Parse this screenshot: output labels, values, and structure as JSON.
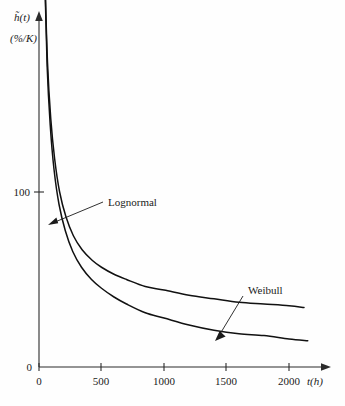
{
  "figure": {
    "background_color": "#fefefe",
    "ink_color": "#111111"
  },
  "labels": {
    "y_axis_symbol": "h̃(t)",
    "y_axis_unit": "(%/K)",
    "x_axis_title": "t(h)",
    "y_origin_label": "0"
  },
  "chart_data": {
    "type": "line",
    "title": "",
    "subtitle": "",
    "xlabel": "t(h)",
    "ylabel": "h̃(t) (%/K)",
    "xlim": [
      0,
      2250
    ],
    "ylim": [
      0,
      560
    ],
    "grid": false,
    "legend_position": "inline-annotations",
    "x_ticks": [
      0,
      500,
      1000,
      1500,
      2000
    ],
    "x_tick_labels": [
      "0",
      "500",
      "1000",
      "1500",
      "2000"
    ],
    "y_ticks": [
      0,
      100
    ],
    "y_tick_labels": [
      "0",
      "100"
    ],
    "annotations": [
      {
        "text": "Lognormal",
        "target_x": 40,
        "target_y": 150,
        "note": "leader arrow points down-left to lower-left steep curve"
      },
      {
        "text": "Weibull",
        "target_x": 1390,
        "target_y": 36,
        "note": "leader arrow points down-left to the upper right-hand curve"
      }
    ],
    "series": [
      {
        "name": "Lognormal",
        "x": [
          12,
          20,
          30,
          45,
          65,
          90,
          120,
          160,
          210,
          270,
          340,
          420,
          500,
          600,
          700,
          850,
          1000,
          1200,
          1400,
          1600,
          1800,
          2000,
          2150
        ],
        "values": [
          545,
          400,
          300,
          225,
          172,
          138,
          113,
          93,
          78,
          66,
          57,
          50,
          45,
          40,
          36,
          31,
          28,
          24,
          21,
          19,
          18,
          16,
          15
        ]
      },
      {
        "name": "Weibull",
        "x": [
          14,
          22,
          33,
          48,
          68,
          94,
          125,
          165,
          215,
          275,
          345,
          425,
          500,
          600,
          700,
          850,
          1000,
          1200,
          1400,
          1600,
          1800,
          2000,
          2120
        ],
        "values": [
          520,
          392,
          296,
          224,
          174,
          142,
          119,
          100,
          86,
          75,
          67,
          61,
          57,
          53,
          50,
          46,
          44,
          41,
          39,
          37,
          36,
          35,
          34
        ]
      }
    ]
  }
}
